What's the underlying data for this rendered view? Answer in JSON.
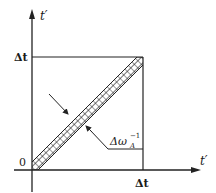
{
  "diagram": {
    "axes": {
      "y_label": "t′",
      "x_label": "t′",
      "origin_label": "0"
    },
    "ticks": {
      "y_tick_label": "Δt",
      "x_tick_label": "Δt"
    },
    "band_annotation": {
      "label_main": "Δω",
      "label_sub": "A",
      "label_sup": "−1"
    },
    "colors": {
      "line": "#222222",
      "hatch": "#222222",
      "background": "#ffffff"
    }
  }
}
